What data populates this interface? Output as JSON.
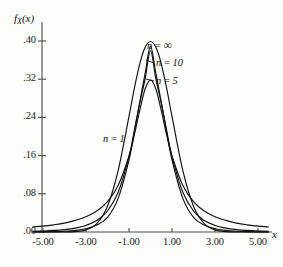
{
  "chart_data": {
    "type": "line",
    "title": "",
    "subtitle": "",
    "xlabel": "x",
    "ylabel": "f_X(x)",
    "xlim": [
      -5.6,
      5.9
    ],
    "ylim": [
      0.0,
      0.435
    ],
    "grid": false,
    "legend_position": "inline-annotations",
    "x_ticks": [
      "-5.00",
      "-3.00",
      "-1.00",
      "1.00",
      "3.00",
      "5.00"
    ],
    "x_tick_values": [
      -5,
      -3,
      -1,
      1,
      3,
      5
    ],
    "y_ticks": [
      ".00",
      ".08",
      ".16",
      ".24",
      ".32",
      ".40"
    ],
    "y_tick_values": [
      0.0,
      0.08,
      0.16,
      0.24,
      0.32,
      0.4
    ],
    "series": [
      {
        "name": "n = 1",
        "label": "n = 1",
        "peak_value": 0.318,
        "x": [
          -5.5,
          -5.0,
          -4.5,
          -4.0,
          -3.5,
          -3.0,
          -2.5,
          -2.0,
          -1.5,
          -1.0,
          -0.75,
          -0.5,
          -0.25,
          0.0,
          0.25,
          0.5,
          0.75,
          1.0,
          1.5,
          2.0,
          2.5,
          3.0,
          3.5,
          4.0,
          4.5,
          5.0,
          5.5
        ],
        "y": [
          0.0104,
          0.0122,
          0.015,
          0.0187,
          0.0243,
          0.0318,
          0.0439,
          0.0637,
          0.0979,
          0.1592,
          0.2037,
          0.2546,
          0.2994,
          0.3183,
          0.2994,
          0.2546,
          0.2037,
          0.1592,
          0.0979,
          0.0637,
          0.0439,
          0.0318,
          0.0243,
          0.0187,
          0.015,
          0.0122,
          0.0104
        ]
      },
      {
        "name": "n = 5",
        "label": "n = 5",
        "peak_value": 0.3796,
        "x": [
          -5.5,
          -5.0,
          -4.5,
          -4.0,
          -3.5,
          -3.0,
          -2.5,
          -2.0,
          -1.5,
          -1.0,
          -0.75,
          -0.5,
          -0.25,
          0.0,
          0.25,
          0.5,
          0.75,
          1.0,
          1.5,
          2.0,
          2.5,
          3.0,
          3.5,
          4.0,
          4.5,
          5.0,
          5.5
        ],
        "y": [
          0.0015,
          0.0022,
          0.0033,
          0.0051,
          0.0082,
          0.0137,
          0.024,
          0.044,
          0.0836,
          0.158,
          0.213,
          0.27,
          0.3208,
          0.3796,
          0.3208,
          0.27,
          0.213,
          0.158,
          0.0836,
          0.044,
          0.024,
          0.0137,
          0.0082,
          0.0051,
          0.0033,
          0.0022,
          0.0015
        ]
      },
      {
        "name": "n = 10",
        "label": "n = 10",
        "peak_value": 0.3891,
        "x": [
          -5.5,
          -5.0,
          -4.5,
          -4.0,
          -3.5,
          -3.0,
          -2.5,
          -2.0,
          -1.5,
          -1.0,
          -0.75,
          -0.5,
          -0.25,
          0.0,
          0.25,
          0.5,
          0.75,
          1.0,
          1.5,
          2.0,
          2.5,
          3.0,
          3.5,
          4.0,
          4.5,
          5.0,
          5.5
        ],
        "y": [
          0.0002,
          0.0004,
          0.0008,
          0.0016,
          0.0033,
          0.0068,
          0.0145,
          0.0307,
          0.0709,
          0.151,
          0.21,
          0.272,
          0.332,
          0.3891,
          0.332,
          0.272,
          0.21,
          0.151,
          0.0709,
          0.0307,
          0.0145,
          0.0068,
          0.0033,
          0.0016,
          0.0008,
          0.0004,
          0.0002
        ]
      },
      {
        "name": "n = infinity",
        "label": "n = ∞",
        "peak_value": 0.3989,
        "x": [
          -5.5,
          -5.0,
          -4.5,
          -4.0,
          -3.5,
          -3.0,
          -2.5,
          -2.0,
          -1.5,
          -1.0,
          -0.75,
          -0.5,
          -0.25,
          0.0,
          0.25,
          0.5,
          0.75,
          1.0,
          1.5,
          2.0,
          2.5,
          3.0,
          3.5,
          4.0,
          4.5,
          5.0,
          5.5
        ],
        "y": [
          1e-05,
          1e-05,
          2e-05,
          0.0001,
          0.0009,
          0.0044,
          0.0175,
          0.054,
          0.1295,
          0.242,
          0.3011,
          0.3521,
          0.3867,
          0.3989,
          0.3867,
          0.3521,
          0.3011,
          0.242,
          0.1295,
          0.054,
          0.0175,
          0.0044,
          0.0009,
          0.0001,
          2e-05,
          1e-05,
          1e-05
        ]
      }
    ],
    "annotations": [
      {
        "text": "n = ∞",
        "for": "n = infinity"
      },
      {
        "text": "n = 10",
        "for": "n = 10"
      },
      {
        "text": "n = 5",
        "for": "n = 5"
      },
      {
        "text": "n = 1",
        "for": "n = 1"
      }
    ]
  },
  "axes": {
    "y_label_prefix": "f",
    "y_label_sub": "X",
    "y_label_suffix": "(x)",
    "x_label": "x"
  },
  "colors": {
    "curve": "#111111",
    "axis": "#4a4a4a",
    "text": "#1a1a1a",
    "background": "#fdfdfc"
  }
}
